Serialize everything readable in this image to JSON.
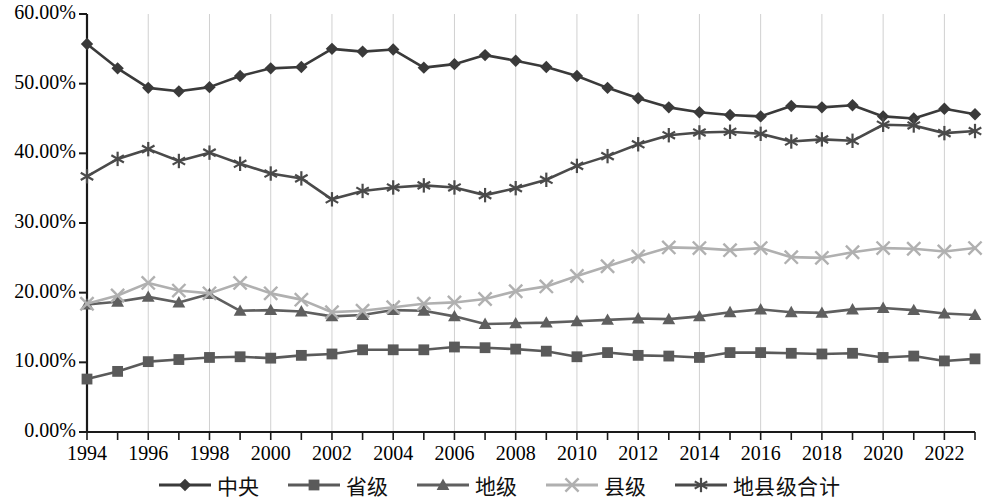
{
  "chart_data": {
    "type": "line",
    "title": "",
    "xlabel": "",
    "ylabel": "",
    "ylim": [
      0,
      0.6
    ],
    "ytick_labels": [
      "0.00%",
      "10.00%",
      "20.00%",
      "30.00%",
      "40.00%",
      "50.00%",
      "60.00%"
    ],
    "ytick_values": [
      0,
      10,
      20,
      30,
      40,
      50,
      60
    ],
    "xtick_labels": [
      "1994",
      "1996",
      "1998",
      "2000",
      "2002",
      "2004",
      "2006",
      "2008",
      "2010",
      "2012",
      "2014",
      "2016",
      "2018",
      "2020",
      "2022"
    ],
    "x": [
      1994,
      1995,
      1996,
      1997,
      1998,
      1999,
      2000,
      2001,
      2002,
      2003,
      2004,
      2005,
      2006,
      2007,
      2008,
      2009,
      2010,
      2011,
      2012,
      2013,
      2014,
      2015,
      2016,
      2017,
      2018,
      2019,
      2020,
      2021,
      2022,
      2023
    ],
    "grid": true,
    "grid_axis": "x",
    "legend_position": "bottom",
    "series": [
      {
        "name": "中央",
        "marker": "diamond",
        "color": "#3a3a3a",
        "values": [
          55.7,
          52.2,
          49.4,
          48.9,
          49.5,
          51.1,
          52.2,
          52.4,
          55.0,
          54.6,
          54.9,
          52.3,
          52.8,
          54.1,
          53.3,
          52.4,
          51.1,
          49.4,
          47.9,
          46.6,
          45.9,
          45.5,
          45.3,
          46.8,
          46.6,
          46.9,
          45.3,
          45.0,
          46.4,
          45.6
        ]
      },
      {
        "name": "省级",
        "marker": "square",
        "color": "#5a5a5a",
        "values": [
          7.6,
          8.7,
          10.1,
          10.4,
          10.7,
          10.8,
          10.6,
          11.0,
          11.2,
          11.8,
          11.8,
          11.8,
          12.2,
          12.1,
          11.9,
          11.6,
          10.8,
          11.4,
          11.0,
          10.9,
          10.7,
          11.4,
          11.4,
          11.3,
          11.2,
          11.3,
          10.7,
          10.9,
          10.2,
          10.5
        ]
      },
      {
        "name": "地级",
        "marker": "triangle",
        "color": "#5f5f5f",
        "values": [
          18.3,
          18.7,
          19.4,
          18.6,
          19.8,
          17.4,
          17.5,
          17.3,
          16.6,
          16.8,
          17.5,
          17.4,
          16.6,
          15.5,
          15.6,
          15.7,
          15.9,
          16.1,
          16.3,
          16.2,
          16.6,
          17.2,
          17.6,
          17.2,
          17.1,
          17.6,
          17.8,
          17.5,
          17.0,
          16.8
        ]
      },
      {
        "name": "县级",
        "marker": "x",
        "color": "#b0b0b0",
        "values": [
          18.4,
          19.6,
          21.4,
          20.3,
          19.9,
          21.4,
          19.9,
          19.0,
          17.2,
          17.4,
          17.9,
          18.4,
          18.6,
          19.1,
          20.2,
          20.9,
          22.4,
          23.8,
          25.2,
          26.5,
          26.4,
          26.1,
          26.4,
          25.1,
          25.0,
          25.8,
          26.4,
          26.3,
          25.9,
          26.4
        ]
      },
      {
        "name": "地县级合计",
        "marker": "asterisk",
        "color": "#4a4a4a",
        "values": [
          36.7,
          39.2,
          40.6,
          38.9,
          40.1,
          38.5,
          37.1,
          36.4,
          33.4,
          34.6,
          35.1,
          35.4,
          35.1,
          34.0,
          35.0,
          36.2,
          38.2,
          39.6,
          41.3,
          42.6,
          43.0,
          43.1,
          42.8,
          41.7,
          42.0,
          41.8,
          44.1,
          44.0,
          42.9,
          43.2
        ]
      }
    ]
  },
  "legend": {
    "items": [
      {
        "label": "中央",
        "marker": "diamond",
        "color": "#3a3a3a"
      },
      {
        "label": "省级",
        "marker": "square",
        "color": "#5a5a5a"
      },
      {
        "label": "地级",
        "marker": "triangle",
        "color": "#5f5f5f"
      },
      {
        "label": "县级",
        "marker": "x",
        "color": "#b0b0b0"
      },
      {
        "label": "地县级合计",
        "marker": "asterisk",
        "color": "#4a4a4a"
      }
    ]
  },
  "axes": {
    "axis_color": "#1a1a1a",
    "grid_color": "#d0d0d0"
  }
}
